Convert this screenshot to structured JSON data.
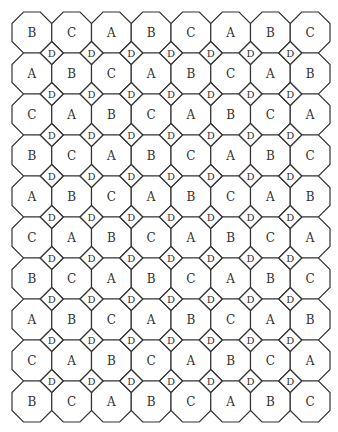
{
  "diagram": {
    "type": "octagon-square tiling",
    "columns": 8,
    "rows": 10,
    "octagon_labels": [
      [
        "B",
        "C",
        "A",
        "B",
        "C",
        "A",
        "B",
        "C"
      ],
      [
        "A",
        "B",
        "C",
        "A",
        "B",
        "C",
        "A",
        "B"
      ],
      [
        "C",
        "A",
        "B",
        "C",
        "A",
        "B",
        "C",
        "A"
      ],
      [
        "B",
        "C",
        "A",
        "B",
        "C",
        "A",
        "B",
        "C"
      ],
      [
        "A",
        "B",
        "C",
        "A",
        "B",
        "C",
        "A",
        "B"
      ],
      [
        "C",
        "A",
        "B",
        "C",
        "A",
        "B",
        "C",
        "A"
      ],
      [
        "B",
        "C",
        "A",
        "B",
        "C",
        "A",
        "B",
        "C"
      ],
      [
        "A",
        "B",
        "C",
        "A",
        "B",
        "C",
        "A",
        "B"
      ],
      [
        "C",
        "A",
        "B",
        "C",
        "A",
        "B",
        "C",
        "A"
      ],
      [
        "B",
        "C",
        "A",
        "B",
        "C",
        "A",
        "B",
        "C"
      ]
    ],
    "square_label": "D",
    "colors": {
      "stroke": "#333333",
      "fill": "#ffffff",
      "text": "#333333"
    },
    "geometry": {
      "origin_x": 12,
      "origin_y": 12,
      "cell_width": 39.75,
      "cell_height": 41,
      "corner_cut": 11.5
    }
  }
}
